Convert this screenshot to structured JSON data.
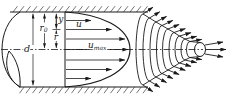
{
  "colors": {
    "ink": "#1a1a1a",
    "background": "#ffffff"
  },
  "diagram": {
    "labels": {
      "diameter": "d",
      "radius_base": "r",
      "radius_subscript": "0",
      "wall_distance": "y",
      "radial_distance": "r",
      "velocity": "u",
      "velocity_max_base": "u",
      "velocity_max_subscript": "max"
    }
  }
}
